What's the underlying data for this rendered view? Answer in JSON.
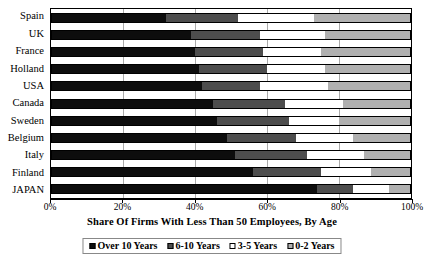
{
  "chart_data": {
    "type": "bar",
    "orientation": "horizontal",
    "stacked": true,
    "stacked_normalized": true,
    "title": "",
    "subtitle": "",
    "xlabel": "Share Of Firms With Less Than 50 Employees, By Age",
    "ylabel": "",
    "xlim": [
      0,
      100
    ],
    "xticks": [
      0,
      20,
      40,
      60,
      80,
      100
    ],
    "xtick_labels": [
      "0%",
      "20%",
      "40%",
      "60%",
      "80%",
      "100%"
    ],
    "grid": true,
    "grid_axis": "x",
    "legend_position": "bottom",
    "categories": [
      "Spain",
      "UK",
      "France",
      "Holland",
      "USA",
      "Canada",
      "Sweden",
      "Belgium",
      "Italy",
      "Finland",
      "JAPAN"
    ],
    "series": [
      {
        "name": "Over 10 Years",
        "color": "#0d0d0d",
        "values": [
          32,
          39,
          40,
          41,
          42,
          45,
          46,
          49,
          51,
          56,
          74
        ]
      },
      {
        "name": "6-10 Years",
        "color": "#4d4d4d",
        "values": [
          20,
          19,
          19,
          19,
          16,
          20,
          20,
          19,
          20,
          19,
          10
        ]
      },
      {
        "name": "3-5 Years",
        "color": "#ffffff",
        "values": [
          21,
          18,
          16,
          16,
          19,
          16,
          14,
          16,
          16,
          14,
          10
        ]
      },
      {
        "name": "0-2 Years",
        "color": "#b0b0b0",
        "values": [
          27,
          24,
          25,
          24,
          23,
          19,
          20,
          16,
          13,
          11,
          6
        ]
      }
    ]
  },
  "legend": {
    "items": [
      {
        "label": "Over 10 Years",
        "swatch": "#0d0d0d"
      },
      {
        "label": "6-10 Years",
        "swatch": "#4d4d4d"
      },
      {
        "label": "3-5 Years",
        "swatch": "#ffffff"
      },
      {
        "label": "0-2 Years",
        "swatch": "#b0b0b0"
      }
    ]
  }
}
